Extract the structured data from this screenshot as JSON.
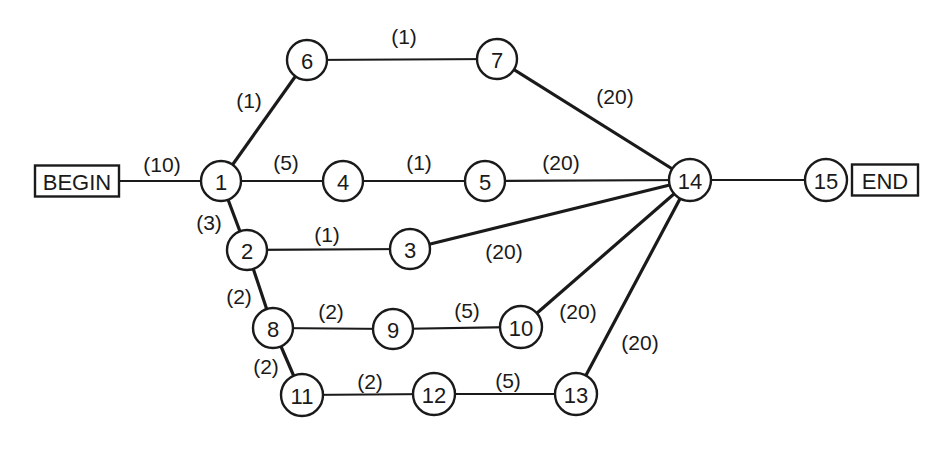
{
  "diagram": {
    "type": "network-graph",
    "terminals": [
      {
        "id": "BEGIN",
        "label": "BEGIN",
        "x": 77,
        "y": 181,
        "w": 84,
        "h": 31
      },
      {
        "id": "END",
        "label": "END",
        "x": 885,
        "y": 180,
        "w": 66,
        "h": 31
      }
    ],
    "nodes": [
      {
        "id": "1",
        "label": "1",
        "x": 221,
        "y": 181
      },
      {
        "id": "2",
        "label": "2",
        "x": 247,
        "y": 250
      },
      {
        "id": "3",
        "label": "3",
        "x": 410,
        "y": 249
      },
      {
        "id": "4",
        "label": "4",
        "x": 343,
        "y": 181
      },
      {
        "id": "5",
        "label": "5",
        "x": 485,
        "y": 181
      },
      {
        "id": "6",
        "label": "6",
        "x": 307,
        "y": 60
      },
      {
        "id": "7",
        "label": "7",
        "x": 497,
        "y": 59
      },
      {
        "id": "8",
        "label": "8",
        "x": 273,
        "y": 328
      },
      {
        "id": "9",
        "label": "9",
        "x": 393,
        "y": 329
      },
      {
        "id": "10",
        "label": "10",
        "x": 521,
        "y": 327
      },
      {
        "id": "11",
        "label": "11",
        "x": 302,
        "y": 395
      },
      {
        "id": "12",
        "label": "12",
        "x": 434,
        "y": 394
      },
      {
        "id": "13",
        "label": "13",
        "x": 576,
        "y": 394
      },
      {
        "id": "14",
        "label": "14",
        "x": 690,
        "y": 180
      },
      {
        "id": "15",
        "label": "15",
        "x": 826,
        "y": 180
      }
    ],
    "edges": [
      {
        "from": "BEGIN",
        "to": "1",
        "weight": "(10)",
        "lx": 162,
        "ly": 164,
        "thick": false
      },
      {
        "from": "1",
        "to": "6",
        "weight": "(1)",
        "lx": 249,
        "ly": 100,
        "thick": true
      },
      {
        "from": "6",
        "to": "7",
        "weight": "(1)",
        "lx": 404,
        "ly": 36,
        "thick": false
      },
      {
        "from": "7",
        "to": "14",
        "weight": "(20)",
        "lx": 615,
        "ly": 96,
        "thick": true
      },
      {
        "from": "1",
        "to": "4",
        "weight": "(5)",
        "lx": 286,
        "ly": 162,
        "thick": false
      },
      {
        "from": "4",
        "to": "5",
        "weight": "(1)",
        "lx": 419,
        "ly": 162,
        "thick": false
      },
      {
        "from": "5",
        "to": "14",
        "weight": "(20)",
        "lx": 561,
        "ly": 162,
        "thick": false
      },
      {
        "from": "1",
        "to": "2",
        "weight": "(3)",
        "lx": 209,
        "ly": 222,
        "thick": true
      },
      {
        "from": "2",
        "to": "3",
        "weight": "(1)",
        "lx": 327,
        "ly": 234,
        "thick": false
      },
      {
        "from": "3",
        "to": "14",
        "weight": "(20)",
        "lx": 504,
        "ly": 251,
        "thick": true
      },
      {
        "from": "2",
        "to": "8",
        "weight": "(2)",
        "lx": 239,
        "ly": 296,
        "thick": true
      },
      {
        "from": "8",
        "to": "9",
        "weight": "(2)",
        "lx": 331,
        "ly": 311,
        "thick": false
      },
      {
        "from": "9",
        "to": "10",
        "weight": "(5)",
        "lx": 467,
        "ly": 310,
        "thick": false
      },
      {
        "from": "10",
        "to": "14",
        "weight": "(20)",
        "lx": 578,
        "ly": 311,
        "thick": true
      },
      {
        "from": "8",
        "to": "11",
        "weight": "(2)",
        "lx": 266,
        "ly": 366,
        "thick": true
      },
      {
        "from": "11",
        "to": "12",
        "weight": "(2)",
        "lx": 370,
        "ly": 381,
        "thick": false
      },
      {
        "from": "12",
        "to": "13",
        "weight": "(5)",
        "lx": 508,
        "ly": 380,
        "thick": false
      },
      {
        "from": "13",
        "to": "14",
        "weight": "(20)",
        "lx": 640,
        "ly": 342,
        "thick": true
      },
      {
        "from": "14",
        "to": "15",
        "weight": "",
        "lx": 0,
        "ly": 0,
        "thick": false
      }
    ]
  },
  "colors": {
    "ink": "#1a1a1a",
    "background": "#ffffff"
  }
}
